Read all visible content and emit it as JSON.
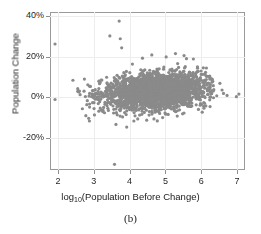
{
  "figure": {
    "caption": "(b)",
    "marker_color": "#8a8a8a",
    "frame_color": "#9a9a9a",
    "grid_color": "#ededed"
  },
  "chart_data": {
    "type": "scatter",
    "title": "",
    "xlabel": "log10(Population Before Change)",
    "xlabel_base": "log",
    "xlabel_sub": "10",
    "xlabel_rest": "(Population Before Change)",
    "ylabel": "Population Change",
    "xlim": [
      1.78,
      7.22
    ],
    "ylim": [
      -0.36,
      0.42
    ],
    "xticks": [
      2,
      3,
      4,
      5,
      6,
      7
    ],
    "xticklabels": [
      "2",
      "3",
      "4",
      "5",
      "6",
      "7"
    ],
    "yticks": [
      0.4,
      0.2,
      0.0,
      -0.2
    ],
    "yticklabels": [
      "40%",
      "20%",
      "0%",
      "-20%"
    ],
    "grid": true,
    "legend": "none",
    "marker_size": 1.6,
    "n_points": 2600,
    "density_model": {
      "x_mean": 4.72,
      "x_sd": 0.72,
      "x_min": 2.55,
      "x_max": 6.45,
      "y_center_at_x3": 0.005,
      "y_center_at_x6": 0.042,
      "y_sd_at_x3": 0.035,
      "y_sd_at_x6": 0.048
    },
    "outliers": [
      {
        "x": 1.92,
        "y": 0.262
      },
      {
        "x": 1.92,
        "y": -0.012
      },
      {
        "x": 2.42,
        "y": 0.083
      },
      {
        "x": 2.62,
        "y": 0.012
      },
      {
        "x": 2.74,
        "y": 0.089
      },
      {
        "x": 2.78,
        "y": -0.092
      },
      {
        "x": 2.86,
        "y": -0.105
      },
      {
        "x": 2.88,
        "y": -0.118
      },
      {
        "x": 3.02,
        "y": -0.088
      },
      {
        "x": 3.18,
        "y": 0.072
      },
      {
        "x": 3.36,
        "y": 0.098
      },
      {
        "x": 3.45,
        "y": 0.302
      },
      {
        "x": 3.58,
        "y": -0.332
      },
      {
        "x": 3.62,
        "y": -0.135
      },
      {
        "x": 3.71,
        "y": 0.375
      },
      {
        "x": 3.74,
        "y": 0.288
      },
      {
        "x": 3.78,
        "y": 0.243
      },
      {
        "x": 3.92,
        "y": -0.148
      },
      {
        "x": 4.08,
        "y": 0.163
      },
      {
        "x": 4.12,
        "y": -0.118
      },
      {
        "x": 4.36,
        "y": 0.192
      },
      {
        "x": 4.62,
        "y": 0.208
      },
      {
        "x": 4.68,
        "y": -0.108
      },
      {
        "x": 5.02,
        "y": 0.198
      },
      {
        "x": 5.28,
        "y": 0.215
      },
      {
        "x": 5.52,
        "y": 0.205
      },
      {
        "x": 5.78,
        "y": 0.188
      },
      {
        "x": 6.12,
        "y": 0.122
      },
      {
        "x": 6.32,
        "y": 0.078
      },
      {
        "x": 6.52,
        "y": 0.068
      },
      {
        "x": 6.58,
        "y": 0.035
      },
      {
        "x": 6.62,
        "y": 0.018
      },
      {
        "x": 6.72,
        "y": 0.008
      },
      {
        "x": 6.98,
        "y": 0.002
      },
      {
        "x": 7.05,
        "y": 0.015
      }
    ]
  }
}
